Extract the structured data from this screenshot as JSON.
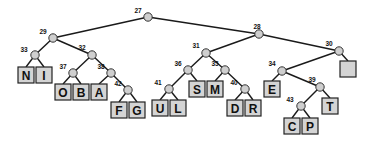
{
  "style": {
    "edge_color": "#1a1a1a",
    "internal_node_fill": "#cfcfcf",
    "leaf_fill": "#d4d4d4",
    "leaf_stroke": "#222222"
  },
  "internal_nodes": [
    {
      "id": "27",
      "label": "27",
      "x": 148,
      "y": 17,
      "lx": -10,
      "ly": -4
    },
    {
      "id": "29",
      "label": "29",
      "x": 53,
      "y": 38,
      "lx": -10,
      "ly": -4
    },
    {
      "id": "28",
      "label": "28",
      "x": 259,
      "y": 34,
      "lx": -2,
      "ly": -5
    },
    {
      "id": "33",
      "label": "33",
      "x": 35,
      "y": 55,
      "lx": -11,
      "ly": -3
    },
    {
      "id": "32",
      "label": "32",
      "x": 92,
      "y": 55,
      "lx": -10,
      "ly": -5
    },
    {
      "id": "37",
      "label": "37",
      "x": 73,
      "y": 73,
      "lx": -10,
      "ly": -4
    },
    {
      "id": "38",
      "label": "38",
      "x": 111,
      "y": 73,
      "lx": -10,
      "ly": -4
    },
    {
      "id": "42",
      "label": "42",
      "x": 128,
      "y": 90,
      "lx": -10,
      "ly": -4
    },
    {
      "id": "31",
      "label": "31",
      "x": 206,
      "y": 53,
      "lx": -10,
      "ly": -5
    },
    {
      "id": "30",
      "label": "30",
      "x": 339,
      "y": 51,
      "lx": -10,
      "ly": -5
    },
    {
      "id": "36",
      "label": "36",
      "x": 188,
      "y": 70,
      "lx": -10,
      "ly": -4
    },
    {
      "id": "35",
      "label": "35",
      "x": 225,
      "y": 70,
      "lx": -10,
      "ly": -4
    },
    {
      "id": "41",
      "label": "41",
      "x": 169,
      "y": 89,
      "lx": -11,
      "ly": -4
    },
    {
      "id": "40",
      "label": "40",
      "x": 245,
      "y": 89,
      "lx": -11,
      "ly": -4
    },
    {
      "id": "34",
      "label": "34",
      "x": 282,
      "y": 71,
      "lx": -10,
      "ly": -5
    },
    {
      "id": "39",
      "label": "39",
      "x": 320,
      "y": 87,
      "lx": -8,
      "ly": -5
    },
    {
      "id": "43",
      "label": "43",
      "x": 301,
      "y": 106,
      "lx": -11,
      "ly": -4
    }
  ],
  "leaves": [
    {
      "id": "N",
      "label": "N",
      "x": 26,
      "y": 75
    },
    {
      "id": "I",
      "label": "I",
      "x": 44,
      "y": 75
    },
    {
      "id": "O",
      "label": "O",
      "x": 63,
      "y": 92
    },
    {
      "id": "B",
      "label": "B",
      "x": 81,
      "y": 92
    },
    {
      "id": "A",
      "label": "A",
      "x": 99,
      "y": 92
    },
    {
      "id": "F",
      "label": "F",
      "x": 119,
      "y": 110
    },
    {
      "id": "G",
      "label": "G",
      "x": 137,
      "y": 110
    },
    {
      "id": "U",
      "label": "U",
      "x": 160,
      "y": 108
    },
    {
      "id": "L",
      "label": "L",
      "x": 178,
      "y": 108
    },
    {
      "id": "S",
      "label": "S",
      "x": 197,
      "y": 89
    },
    {
      "id": "M",
      "label": "M",
      "x": 215,
      "y": 89
    },
    {
      "id": "D",
      "label": "D",
      "x": 235,
      "y": 108
    },
    {
      "id": "R",
      "label": "R",
      "x": 253,
      "y": 108
    },
    {
      "id": "empty",
      "label": "",
      "x": 348,
      "y": 69
    },
    {
      "id": "E",
      "label": "E",
      "x": 272,
      "y": 89
    },
    {
      "id": "T",
      "label": "T",
      "x": 330,
      "y": 106
    },
    {
      "id": "C",
      "label": "C",
      "x": 292,
      "y": 126
    },
    {
      "id": "P",
      "label": "P",
      "x": 310,
      "y": 126
    }
  ],
  "edges": [
    [
      "27",
      "29"
    ],
    [
      "27",
      "28"
    ],
    [
      "29",
      "33"
    ],
    [
      "29",
      "32"
    ],
    [
      "33",
      "N"
    ],
    [
      "33",
      "I"
    ],
    [
      "32",
      "37"
    ],
    [
      "32",
      "38"
    ],
    [
      "37",
      "O"
    ],
    [
      "37",
      "B"
    ],
    [
      "38",
      "A"
    ],
    [
      "38",
      "42"
    ],
    [
      "42",
      "F"
    ],
    [
      "42",
      "G"
    ],
    [
      "28",
      "31"
    ],
    [
      "28",
      "30"
    ],
    [
      "31",
      "36"
    ],
    [
      "31",
      "35"
    ],
    [
      "36",
      "41"
    ],
    [
      "36",
      "S"
    ],
    [
      "41",
      "U"
    ],
    [
      "41",
      "L"
    ],
    [
      "35",
      "M"
    ],
    [
      "35",
      "40"
    ],
    [
      "40",
      "D"
    ],
    [
      "40",
      "R"
    ],
    [
      "30",
      "34"
    ],
    [
      "30",
      "empty"
    ],
    [
      "34",
      "E"
    ],
    [
      "34",
      "39"
    ],
    [
      "39",
      "43"
    ],
    [
      "39",
      "T"
    ],
    [
      "43",
      "C"
    ],
    [
      "43",
      "P"
    ]
  ]
}
